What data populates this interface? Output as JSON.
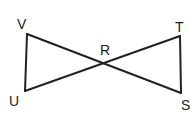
{
  "diagram": {
    "points": {
      "V": {
        "label": "V",
        "x": 27,
        "y": 34
      },
      "U": {
        "label": "U",
        "x": 25,
        "y": 91
      },
      "R": {
        "label": "R",
        "x": 105,
        "y": 60
      },
      "T": {
        "label": "T",
        "x": 180,
        "y": 36
      },
      "S": {
        "label": "S",
        "x": 181,
        "y": 93
      }
    },
    "segments": [
      "VU",
      "VS",
      "UT",
      "TS"
    ],
    "labels": {
      "V": "V",
      "T": "T",
      "R": "R",
      "U": "U",
      "S": "S"
    }
  }
}
